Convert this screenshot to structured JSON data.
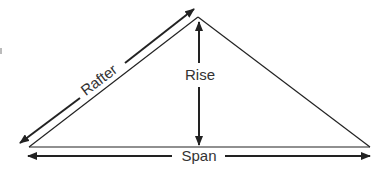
{
  "diagram": {
    "labels": {
      "rafter": "Rafter",
      "rise": "Rise",
      "span": "Span"
    },
    "colors": {
      "line": "#222222",
      "text": "#333333",
      "background": "#ffffff"
    },
    "geometry": {
      "apex": [
        198,
        17
      ],
      "left_base": [
        29,
        147
      ],
      "right_base": [
        370,
        147
      ]
    }
  }
}
